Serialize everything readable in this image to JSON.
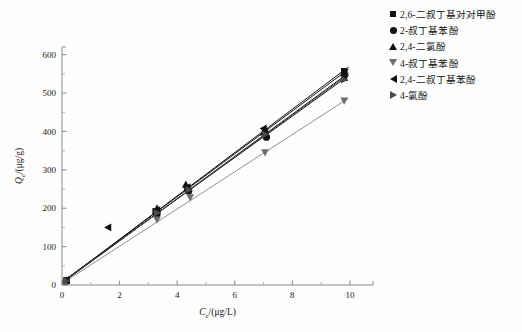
{
  "chart_data": {
    "type": "scatter",
    "title": "",
    "xlabel": "Ce/(μg/L)",
    "ylabel": "Qe/(μg/g)",
    "xlabel_parts": {
      "sym": "C",
      "sub": "e",
      "unit": "/(μg/L)"
    },
    "ylabel_parts": {
      "sym": "Q",
      "sub": "e",
      "unit": "/(μg/g)"
    },
    "xlim": [
      0,
      10.8
    ],
    "ylim": [
      0,
      620
    ],
    "xticks": [
      0,
      2,
      4,
      6,
      8,
      10
    ],
    "yticks": [
      0,
      100,
      200,
      300,
      400,
      500,
      600
    ],
    "xticklabels": [
      "0",
      "2",
      "4",
      "6",
      "8",
      "10"
    ],
    "yticklabels": [
      "0",
      "100",
      "200",
      "300",
      "400",
      "500",
      "600"
    ],
    "grid": false,
    "legend_position": "right",
    "series": [
      {
        "name": "2,6-二叔丁基对对甲酚",
        "marker": "square",
        "color": "#111111",
        "fit_slope": 56.5,
        "fit_intercept": 6,
        "x": [
          0.15,
          3.25,
          4.35,
          7.05,
          9.8
        ],
        "y": [
          12,
          192,
          252,
          400,
          557
        ]
      },
      {
        "name": "2-叔丁基苯酚",
        "marker": "circle",
        "color": "#111111",
        "fit_slope": 55.0,
        "fit_intercept": 5,
        "x": [
          0.15,
          3.3,
          4.4,
          7.1,
          9.8
        ],
        "y": [
          10,
          185,
          245,
          385,
          545
        ]
      },
      {
        "name": "2,4-二氯酚",
        "marker": "triangle-up",
        "color": "#111111",
        "fit_slope": 54.0,
        "fit_intercept": 8,
        "x": [
          0.15,
          3.3,
          4.3,
          7.0,
          9.8
        ],
        "y": [
          12,
          200,
          262,
          398,
          540
        ]
      },
      {
        "name": "4-叔丁基苯酚",
        "marker": "triangle-down",
        "color": "#6e6e6e",
        "fit_slope": 48.5,
        "fit_intercept": 4,
        "x": [
          0.15,
          3.3,
          4.45,
          7.05,
          9.8
        ],
        "y": [
          9,
          170,
          228,
          345,
          480
        ]
      },
      {
        "name": "2,4-二叔丁基苯酚",
        "marker": "triangle-left",
        "color": "#111111",
        "fit_slope": 55.8,
        "fit_intercept": 7,
        "x": [
          0.15,
          1.6,
          3.3,
          4.35,
          7.0,
          9.8
        ],
        "y": [
          13,
          150,
          195,
          255,
          408,
          550
        ]
      },
      {
        "name": "4-氯酚",
        "marker": "triangle-right",
        "color": "#4a4a4a",
        "fit_slope": 54.6,
        "fit_intercept": 6,
        "x": [
          0.15,
          3.3,
          4.4,
          7.05,
          9.8
        ],
        "y": [
          11,
          188,
          248,
          392,
          535
        ]
      }
    ]
  },
  "legend": {
    "items": [
      {
        "label": "2,6-二叔丁基对对甲酚",
        "marker": "square"
      },
      {
        "label": "2-叔丁基苯酚",
        "marker": "circle"
      },
      {
        "label": "2,4-二氯酚",
        "marker": "triangle-up"
      },
      {
        "label": "4-叔丁基苯酚",
        "marker": "triangle-down"
      },
      {
        "label": "2,4-二叔丁基苯酚",
        "marker": "triangle-left"
      },
      {
        "label": "4-氯酚",
        "marker": "triangle-right"
      }
    ]
  },
  "axis_labels": {
    "x_sym": "C",
    "x_sub": "e",
    "x_unit": "/(μg/L)",
    "y_sym": "Q",
    "y_sub": "e",
    "y_unit": "/(μg/g)"
  }
}
